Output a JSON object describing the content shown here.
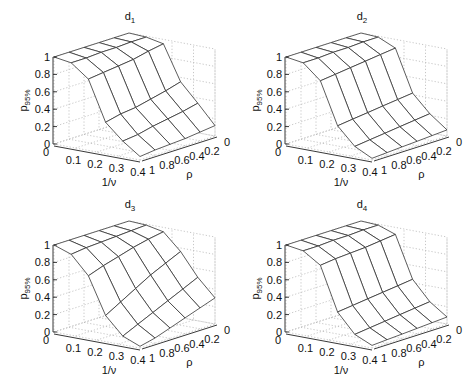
{
  "chart_data": [
    {
      "type": "surface",
      "title": "d1",
      "title_main": "d",
      "title_sub": "1",
      "xlabel": "1/ν",
      "ylabel": "ρ",
      "zlabel_main": "p",
      "zlabel_sub": "95%",
      "x": [
        0,
        0.08,
        0.16,
        0.24,
        0.32,
        0.4
      ],
      "y": [
        1,
        0.8,
        0.6,
        0.4,
        0.2,
        0
      ],
      "xticks": [
        "0",
        "0.1",
        "0.2",
        "0.3",
        "0.4"
      ],
      "yticks": [
        "1",
        "0.8",
        "0.6",
        "0.4",
        "0.2",
        "0"
      ],
      "zticks": [
        "0",
        "0.2",
        "0.4",
        "0.6",
        "0.8",
        "1"
      ],
      "xlim": [
        0,
        0.4
      ],
      "ylim": [
        1,
        0
      ],
      "zlim": [
        0,
        1
      ],
      "z": [
        [
          1.0,
          0.97,
          0.82,
          0.36,
          0.18,
          0.04
        ],
        [
          1.0,
          0.97,
          0.84,
          0.4,
          0.2,
          0.06
        ],
        [
          1.0,
          0.98,
          0.86,
          0.42,
          0.24,
          0.07
        ],
        [
          1.0,
          0.98,
          0.88,
          0.46,
          0.27,
          0.08
        ],
        [
          1.0,
          0.99,
          0.92,
          0.5,
          0.3,
          0.1
        ],
        [
          1.0,
          0.99,
          0.95,
          0.55,
          0.34,
          0.12
        ]
      ]
    },
    {
      "type": "surface",
      "title": "d2",
      "title_main": "d",
      "title_sub": "2",
      "xlabel": "1/ν",
      "ylabel": "ρ",
      "zlabel_main": "p",
      "zlabel_sub": "95%",
      "x": [
        0,
        0.08,
        0.16,
        0.24,
        0.32,
        0.4
      ],
      "y": [
        1,
        0.8,
        0.6,
        0.4,
        0.2,
        0
      ],
      "xticks": [
        "0",
        "0.1",
        "0.2",
        "0.3",
        "0.4"
      ],
      "yticks": [
        "1",
        "0.8",
        "0.6",
        "0.4",
        "0.2",
        "0"
      ],
      "zticks": [
        "0",
        "0.2",
        "0.4",
        "0.6",
        "0.8",
        "1"
      ],
      "xlim": [
        0,
        0.4
      ],
      "ylim": [
        1,
        0
      ],
      "zlim": [
        0,
        1
      ],
      "z": [
        [
          1.0,
          0.97,
          0.8,
          0.32,
          0.12,
          0.02
        ],
        [
          1.0,
          0.97,
          0.82,
          0.34,
          0.14,
          0.03
        ],
        [
          1.0,
          0.98,
          0.84,
          0.36,
          0.16,
          0.04
        ],
        [
          1.0,
          0.98,
          0.86,
          0.38,
          0.18,
          0.05
        ],
        [
          1.0,
          0.99,
          0.88,
          0.4,
          0.2,
          0.06
        ],
        [
          1.0,
          0.99,
          0.9,
          0.42,
          0.22,
          0.07
        ]
      ]
    },
    {
      "type": "surface",
      "title": "d3",
      "title_main": "d",
      "title_sub": "3",
      "xlabel": "1/ν",
      "ylabel": "ρ",
      "zlabel_main": "p",
      "zlabel_sub": "95%",
      "x": [
        0,
        0.08,
        0.16,
        0.24,
        0.32,
        0.4
      ],
      "y": [
        1,
        0.8,
        0.6,
        0.4,
        0.2,
        0
      ],
      "xticks": [
        "0",
        "0.1",
        "0.2",
        "0.3",
        "0.4"
      ],
      "yticks": [
        "1",
        "0.8",
        "0.6",
        "0.4",
        "0.2",
        "0"
      ],
      "zticks": [
        "0",
        "0.2",
        "0.4",
        "0.6",
        "0.8",
        "1"
      ],
      "xlim": [
        0,
        0.4
      ],
      "ylim": [
        1,
        0
      ],
      "zlim": [
        0,
        1
      ],
      "z": [
        [
          1.0,
          0.93,
          0.72,
          0.3,
          0.1,
          0.02
        ],
        [
          1.0,
          0.95,
          0.78,
          0.4,
          0.18,
          0.06
        ],
        [
          1.0,
          0.96,
          0.83,
          0.5,
          0.26,
          0.12
        ],
        [
          1.0,
          0.97,
          0.88,
          0.6,
          0.34,
          0.18
        ],
        [
          1.0,
          0.98,
          0.92,
          0.68,
          0.42,
          0.24
        ],
        [
          1.0,
          0.99,
          0.95,
          0.76,
          0.5,
          0.3
        ]
      ]
    },
    {
      "type": "surface",
      "title": "d4",
      "title_main": "d",
      "title_sub": "4",
      "xlabel": "1/ν",
      "ylabel": "ρ",
      "zlabel_main": "p",
      "zlabel_sub": "95%",
      "x": [
        0,
        0.08,
        0.16,
        0.24,
        0.32,
        0.4
      ],
      "y": [
        1,
        0.8,
        0.6,
        0.4,
        0.2,
        0
      ],
      "xticks": [
        "0",
        "0.1",
        "0.2",
        "0.3",
        "0.4"
      ],
      "yticks": [
        "1",
        "0.8",
        "0.6",
        "0.4",
        "0.2",
        "0"
      ],
      "zticks": [
        "0",
        "0.2",
        "0.4",
        "0.6",
        "0.8",
        "1"
      ],
      "xlim": [
        0,
        0.4
      ],
      "ylim": [
        1,
        0
      ],
      "zlim": [
        0,
        1
      ],
      "z": [
        [
          1.0,
          0.97,
          0.84,
          0.34,
          0.12,
          0.03
        ],
        [
          1.0,
          0.97,
          0.86,
          0.36,
          0.14,
          0.04
        ],
        [
          1.0,
          0.98,
          0.87,
          0.38,
          0.16,
          0.05
        ],
        [
          1.0,
          0.98,
          0.88,
          0.4,
          0.18,
          0.06
        ],
        [
          1.0,
          0.99,
          0.9,
          0.42,
          0.2,
          0.07
        ],
        [
          1.0,
          0.99,
          0.92,
          0.44,
          0.22,
          0.08
        ]
      ]
    }
  ],
  "panels": [
    {
      "left": 0,
      "top": 0
    },
    {
      "left": 232,
      "top": 0
    },
    {
      "left": 0,
      "top": 188
    },
    {
      "left": 232,
      "top": 188
    }
  ]
}
